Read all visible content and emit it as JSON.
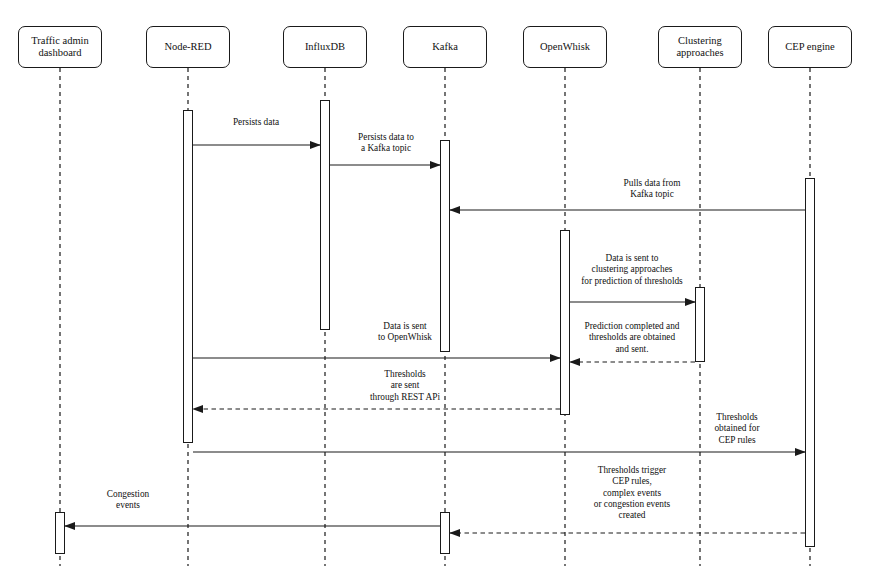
{
  "diagram": {
    "type": "uml-sequence-diagram",
    "width": 885,
    "height": 584,
    "stroke_color": "#1a1a1a",
    "background_color": "#ffffff"
  },
  "participants": [
    {
      "id": "dashboard",
      "label": "Traffic admin\ndashboard",
      "x": 60,
      "box_x": 18,
      "box_y": 26,
      "box_w": 84,
      "box_h": 42
    },
    {
      "id": "nodered",
      "label": "Node-RED",
      "x": 188,
      "box_x": 146,
      "box_y": 26,
      "box_w": 84,
      "box_h": 42
    },
    {
      "id": "influxdb",
      "label": "InfluxDB",
      "x": 325,
      "box_x": 283,
      "box_y": 26,
      "box_w": 84,
      "box_h": 42
    },
    {
      "id": "kafka",
      "label": "Kafka",
      "x": 445,
      "box_x": 403,
      "box_y": 26,
      "box_w": 84,
      "box_h": 42
    },
    {
      "id": "openwhisk",
      "label": "OpenWhisk",
      "x": 565,
      "box_x": 523,
      "box_y": 26,
      "box_w": 84,
      "box_h": 42
    },
    {
      "id": "clustering",
      "label": "Clustering\napproaches",
      "x": 700,
      "box_x": 658,
      "box_y": 26,
      "box_w": 84,
      "box_h": 42
    },
    {
      "id": "cep",
      "label": "CEP engine",
      "x": 810,
      "box_x": 768,
      "box_y": 26,
      "box_w": 84,
      "box_h": 42
    }
  ],
  "lifelines": {
    "top": 68,
    "bottom": 566,
    "style": "dashed"
  },
  "activations": [
    {
      "id": "act-nodered",
      "participant": "nodered",
      "x": 183,
      "y": 110,
      "w": 10,
      "h": 333
    },
    {
      "id": "act-influxdb",
      "participant": "influxdb",
      "x": 320,
      "y": 100,
      "w": 10,
      "h": 230
    },
    {
      "id": "act-kafka",
      "participant": "kafka",
      "x": 440,
      "y": 140,
      "w": 10,
      "h": 212
    },
    {
      "id": "act-openwhisk",
      "participant": "openwhisk",
      "x": 560,
      "y": 230,
      "w": 10,
      "h": 185
    },
    {
      "id": "act-clustering",
      "participant": "clustering",
      "x": 695,
      "y": 287,
      "w": 10,
      "h": 75
    },
    {
      "id": "act-cep",
      "participant": "cep",
      "x": 805,
      "y": 178,
      "w": 10,
      "h": 369
    },
    {
      "id": "act-dashboard-bottom",
      "participant": "dashboard",
      "x": 55,
      "y": 512,
      "w": 10,
      "h": 42
    },
    {
      "id": "act-kafka-bottom",
      "participant": "kafka",
      "x": 440,
      "y": 512,
      "w": 10,
      "h": 42
    }
  ],
  "messages": [
    {
      "id": "msg-persists-data",
      "label": "Persists data",
      "from": "nodered",
      "to": "influxdb",
      "x1": 193,
      "x2": 320,
      "y": 145,
      "label_x": 256,
      "label_y": 117,
      "direction": "right",
      "line": "solid"
    },
    {
      "id": "msg-persists-kafka-topic",
      "label": "Persists data to\na Kafka topic",
      "from": "influxdb",
      "to": "kafka",
      "x1": 330,
      "x2": 440,
      "y": 165,
      "label_x": 386,
      "label_y": 132,
      "direction": "right",
      "line": "solid"
    },
    {
      "id": "msg-pulls-data",
      "label": "Pulls data from\nKafka topic",
      "from": "cep",
      "to": "kafka",
      "x1": 805,
      "x2": 450,
      "y": 210,
      "label_x": 652,
      "label_y": 178,
      "direction": "left",
      "line": "solid"
    },
    {
      "id": "msg-data-to-clustering",
      "label": "Data is sent to\nclustering approaches\nfor prediction of thresholds",
      "from": "openwhisk",
      "to": "clustering",
      "x1": 570,
      "x2": 695,
      "y": 302,
      "label_x": 632,
      "label_y": 253,
      "direction": "right",
      "line": "solid"
    },
    {
      "id": "msg-data-to-openwhisk",
      "label": "Data is sent\nto OpenWhisk",
      "from": "nodered",
      "to": "openwhisk",
      "x1": 193,
      "x2": 560,
      "y": 358,
      "label_x": 405,
      "label_y": 321,
      "direction": "right",
      "line": "solid"
    },
    {
      "id": "msg-prediction-completed",
      "label": "Prediction completed and\nthresholds are obtained\nand sent.",
      "from": "clustering",
      "to": "openwhisk",
      "x1": 695,
      "x2": 570,
      "y": 362,
      "label_x": 632,
      "label_y": 321,
      "direction": "left",
      "line": "dashed"
    },
    {
      "id": "msg-thresholds-rest-api",
      "label": "Thresholds\nare sent\nthrough REST APi",
      "from": "openwhisk",
      "to": "nodered",
      "x1": 560,
      "x2": 193,
      "y": 409,
      "label_x": 405,
      "label_y": 369,
      "direction": "left",
      "line": "dashed"
    },
    {
      "id": "msg-thresholds-cep-rules",
      "label": "Thresholds\nobtained for\nCEP rules",
      "from": "nodered",
      "to": "cep",
      "x1": 193,
      "x2": 805,
      "y": 452,
      "label_x": 737,
      "label_y": 412,
      "direction": "right",
      "line": "solid"
    },
    {
      "id": "msg-thresholds-trigger",
      "label": "Thresholds trigger\nCEP rules,\ncomplex events\nor congestion events\ncreated",
      "from": "cep",
      "to": "kafka",
      "x1": 805,
      "x2": 450,
      "y": 533,
      "label_x": 632,
      "label_y": 465,
      "direction": "left",
      "line": "dashed"
    },
    {
      "id": "msg-congestion-events",
      "label": "Congestion\nevents",
      "from": "kafka",
      "to": "dashboard",
      "x1": 440,
      "x2": 65,
      "y": 526,
      "label_x": 128,
      "label_y": 489,
      "direction": "left",
      "line": "solid"
    }
  ]
}
